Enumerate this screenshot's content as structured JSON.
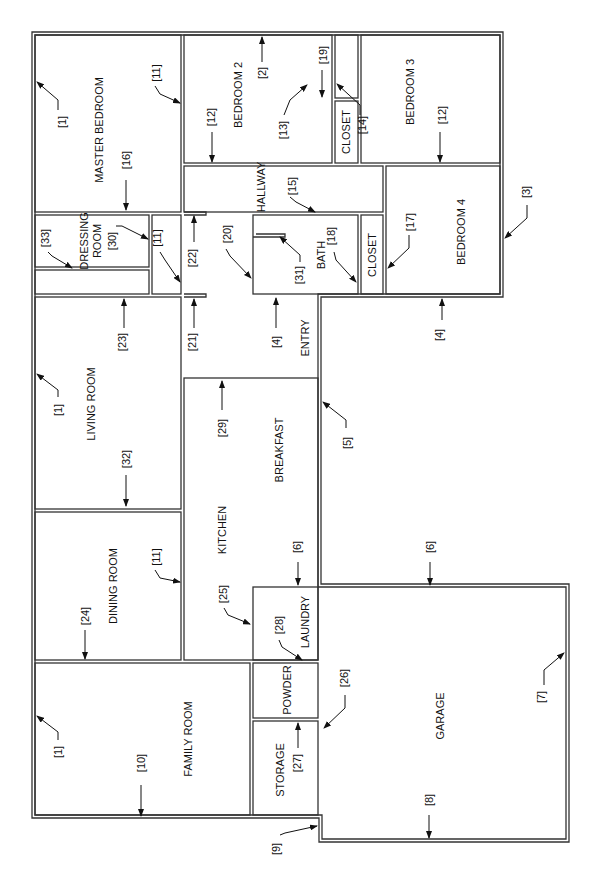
{
  "rooms": {
    "master_bedroom": "MASTER BEDROOM",
    "bedroom2": "BEDROOM 2",
    "bedroom3": "BEDROOM 3",
    "bedroom4": "BEDROOM 4",
    "closet_top": "CLOSET",
    "closet_mid": "CLOSET",
    "hallway": "HALLWAY",
    "bath": "BATH",
    "dressing_room_1": "DRESSING",
    "dressing_room_2": "ROOM",
    "entry": "ENTRY",
    "living_room": "LIVING ROOM",
    "breakfast": "BREAKFAST",
    "kitchen": "KITCHEN",
    "dining_room": "DINING ROOM",
    "laundry": "LAUNDRY",
    "powder": "POWDER",
    "storage": "STORAGE",
    "family_room": "FAMILY ROOM",
    "garage": "GARAGE"
  },
  "callouts": {
    "c1a": "[1]",
    "c1b": "[1]",
    "c1c": "[1]",
    "c2": "[2]",
    "c3": "[3]",
    "c4a": "[4]",
    "c4b": "[4]",
    "c5": "[5]",
    "c6a": "[6]",
    "c6b": "[6]",
    "c7": "[7]",
    "c8": "[8]",
    "c9": "[9]",
    "c10": "[10]",
    "c11a": "[11]",
    "c11b": "[11]",
    "c11c": "[11]",
    "c12a": "[12]",
    "c12b": "[12]",
    "c13": "[13]",
    "c14": "[14]",
    "c15": "[15]",
    "c16": "[16]",
    "c17": "[17]",
    "c18": "[18]",
    "c19": "[19]",
    "c20": "[20]",
    "c21": "[21]",
    "c22": "[22]",
    "c23": "[23]",
    "c24": "[24]",
    "c25": "[25]",
    "c26": "[26]",
    "c27": "[27]",
    "c28": "[28]",
    "c29": "[29]",
    "c30": "[30]",
    "c31": "[31]",
    "c32": "[32]",
    "c33": "[33]"
  }
}
